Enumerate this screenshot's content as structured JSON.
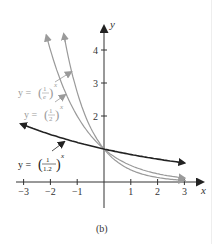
{
  "chart_data": {
    "type": "line",
    "title": "",
    "caption": "(b)",
    "xlabel": "x",
    "ylabel": "y",
    "xlim": [
      -3,
      3
    ],
    "ylim": [
      0,
      4.5
    ],
    "xticks": [
      -3,
      -2,
      -1,
      1,
      2,
      3
    ],
    "yticks": [
      1,
      2,
      3,
      4
    ],
    "grid": false,
    "series": [
      {
        "name": "y = (1/e)^x",
        "base": 0.36788,
        "color": "#9a9a9a",
        "label_text": "y = (1/e)",
        "label_exp": "x",
        "x_start": -1.5
      },
      {
        "name": "y = (1/2)^x",
        "base": 0.5,
        "color": "#9a9a9a",
        "label_text": "y = (1/2)",
        "label_exp": "x",
        "x_start": -2.15
      },
      {
        "name": "y = (1/1.2)^x",
        "base": 0.83333,
        "color": "#222222",
        "label_text": "y = (1/1.2)",
        "label_exp": "x",
        "x_start": -3.1
      }
    ]
  },
  "labels": {
    "x_axis": "x",
    "y_axis": "y",
    "caption": "(b)",
    "eq_e": {
      "lhs": "y = ",
      "num": "1",
      "den": "e",
      "exp": "x"
    },
    "eq_2": {
      "lhs": "y = ",
      "num": "1",
      "den": "2",
      "exp": "x"
    },
    "eq_12": {
      "lhs": "y = ",
      "num": "1",
      "den": "1.2",
      "exp": "x"
    },
    "ticks_x": [
      "−3",
      "−2",
      "−1",
      "1",
      "2",
      "3"
    ],
    "ticks_y": [
      "1",
      "2",
      "3",
      "4"
    ]
  },
  "colors": {
    "light_curve": "#9a9a9a",
    "dark_curve": "#222222",
    "axis": "#333333"
  }
}
